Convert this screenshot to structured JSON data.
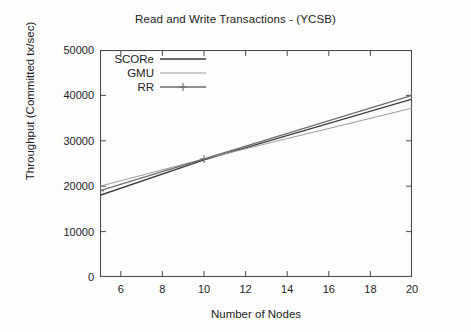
{
  "chart_data": {
    "type": "line",
    "title": "Read and Write Transactions - (YCSB)",
    "xlabel": "Number of Nodes",
    "ylabel": "Throughput (Committed tx/sec)",
    "xlim": [
      5,
      20
    ],
    "ylim": [
      0,
      50000
    ],
    "xticks": [
      6,
      8,
      10,
      12,
      14,
      16,
      18,
      20
    ],
    "yticks": [
      0,
      10000,
      20000,
      30000,
      40000,
      50000
    ],
    "xtick_labels": [
      "6",
      "8",
      "10",
      "12",
      "14",
      "16",
      "18",
      "20"
    ],
    "ytick_labels": [
      "0",
      "10000",
      "20000",
      "30000",
      "40000",
      "50000"
    ],
    "grid": false,
    "legend_position": "top-left inside",
    "x": [
      5,
      10,
      20
    ],
    "series": [
      {
        "name": "SCORe",
        "style": "solid",
        "color": "#3a3a3a",
        "marker": "none",
        "values": [
          18000,
          25800,
          39200
        ]
      },
      {
        "name": "GMU",
        "style": "solid-light",
        "color": "#9a9a9a",
        "marker": "none",
        "values": [
          20000,
          26000,
          37200
        ]
      },
      {
        "name": "RR",
        "style": "solid",
        "color": "#6b6b6b",
        "marker": "plus",
        "values": [
          19000,
          26000,
          40000
        ]
      }
    ]
  },
  "legend": {
    "items": [
      {
        "label": "SCORe"
      },
      {
        "label": "GMU"
      },
      {
        "label": "RR"
      }
    ]
  },
  "colors": {
    "axis": "#4a4a4a",
    "text": "#222222",
    "background": "#fdfdfd"
  }
}
